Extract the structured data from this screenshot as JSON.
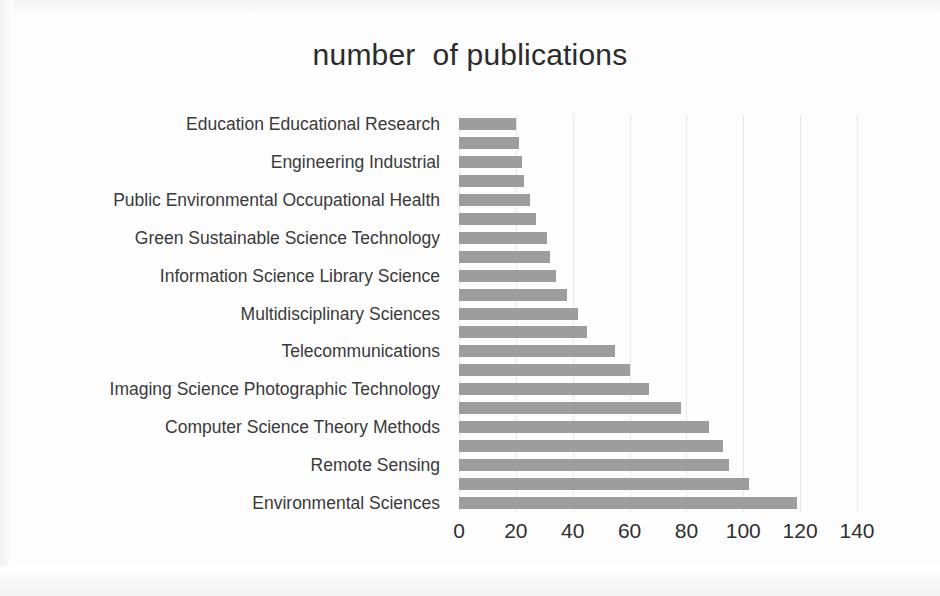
{
  "chart_data": {
    "type": "bar",
    "orientation": "horizontal",
    "title": "number  of publications",
    "xlabel": "",
    "ylabel": "",
    "xlim": [
      0,
      140
    ],
    "xticks": [
      0,
      20,
      40,
      60,
      80,
      100,
      120,
      140
    ],
    "xtick_labels": [
      "0",
      "20",
      "40",
      "60",
      "80",
      "100",
      "120",
      "140"
    ],
    "grid": "vertical",
    "legend": "none",
    "bar_color": "#9d9d9d",
    "categories": [
      "Education Educational Research",
      "",
      "Engineering Industrial",
      "",
      "Public Environmental Occupational Health",
      "",
      "Green Sustainable Science Technology",
      "",
      "Information Science Library Science",
      "",
      "Multidisciplinary Sciences",
      "",
      "Telecommunications",
      "",
      "Imaging Science Photographic Technology",
      "",
      "Computer Science Theory Methods",
      "",
      "Remote Sensing",
      "",
      "Environmental Sciences"
    ],
    "values": [
      20,
      21,
      22,
      23,
      25,
      27,
      31,
      32,
      34,
      38,
      42,
      45,
      55,
      60,
      67,
      78,
      88,
      93,
      95,
      102,
      119
    ],
    "labeled_categories": [
      "Education Educational Research",
      "Engineering Industrial",
      "Public Environmental Occupational Health",
      "Green Sustainable Science Technology",
      "Information Science Library Science",
      "Multidisciplinary Sciences",
      "Telecommunications",
      "Imaging Science Photographic Technology",
      "Computer Science Theory Methods",
      "Remote Sensing",
      "Environmental Sciences"
    ],
    "note": "Axis category labels are shown on every other bar."
  }
}
